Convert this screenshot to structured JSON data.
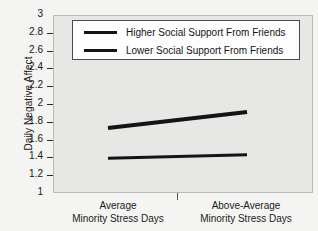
{
  "chart_data": {
    "type": "line",
    "title": "",
    "xlabel": "",
    "ylabel": "Daily Negative Affect",
    "categories": [
      "Average\nMinority Stress Days",
      "Above-Average\nMinority Stress Days"
    ],
    "category_lines": [
      {
        "line1": "Average",
        "line2": "Minority Stress Days"
      },
      {
        "line1": "Above-Average",
        "line2": "Minority Stress Days"
      }
    ],
    "ylim": [
      1,
      3
    ],
    "ytick_values": [
      3,
      2.8,
      2.6,
      2.4,
      2.2,
      2,
      1.8,
      1.6,
      1.4,
      1.2,
      1
    ],
    "ytick_labels": [
      "3",
      "2.8",
      "2.6",
      "2.4",
      "2.2",
      "2",
      "1.8",
      "1.6",
      "1.4",
      "1.2",
      "1"
    ],
    "grid": false,
    "legend_position": "top-center",
    "series": [
      {
        "name": "Higher Social Support From Friends",
        "values": [
          1.73,
          1.91
        ],
        "color": "#141414",
        "width": 4
      },
      {
        "name": "Lower Social Support From Friends",
        "values": [
          1.39,
          1.43
        ],
        "color": "#141414",
        "width": 3
      }
    ]
  },
  "legend": {
    "entries": [
      {
        "label": "Higher Social Support From Friends"
      },
      {
        "label": "Lower Social Support From Friends"
      }
    ]
  },
  "colors": {
    "plot_background": "#e7e7e5",
    "page_background": "#f4f4f2",
    "axis": "#2a2a2a",
    "series": "#141414"
  }
}
